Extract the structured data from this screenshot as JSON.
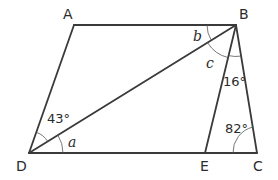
{
  "diagram": {
    "type": "geometry-figure",
    "points": {
      "A": {
        "label": "A",
        "x": 74,
        "y": 25
      },
      "B": {
        "label": "B",
        "x": 236,
        "y": 25
      },
      "C": {
        "label": "C",
        "x": 257,
        "y": 153
      },
      "D": {
        "label": "D",
        "x": 29,
        "y": 153
      },
      "E": {
        "label": "E",
        "x": 205,
        "y": 153
      }
    },
    "segments": [
      "AB",
      "AD",
      "DB",
      "BE",
      "BC",
      "DC"
    ],
    "angles": {
      "ADB": "43°",
      "BDC": "a",
      "ABD": "b",
      "DBE": "c",
      "EBC": "16°",
      "BCE": "82°"
    },
    "colors": {
      "line": "#3a3a3a",
      "arc": "#555555",
      "text": "#2b2b2b"
    }
  }
}
